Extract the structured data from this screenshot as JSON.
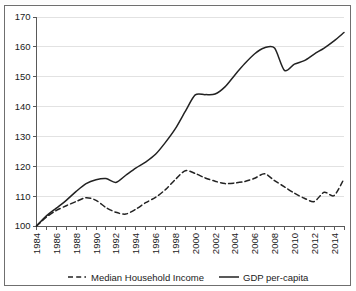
{
  "chart_data": {
    "type": "line",
    "title": "",
    "xlabel": "",
    "ylabel": "",
    "xlim": [
      1984,
      2015
    ],
    "ylim": [
      100,
      170
    ],
    "ytick_step": 10,
    "xtick_step": 2,
    "grid": true,
    "legend_position": "bottom",
    "yticks": [
      "100",
      "110",
      "120",
      "130",
      "140",
      "150",
      "160",
      "170"
    ],
    "xticks": [
      "1984",
      "1986",
      "1988",
      "1990",
      "1992",
      "1994",
      "1996",
      "1998",
      "2000",
      "2002",
      "2004",
      "2006",
      "2008",
      "2010",
      "2012",
      "2014"
    ],
    "x": [
      1984,
      1985,
      1986,
      1987,
      1988,
      1989,
      1990,
      1991,
      1992,
      1993,
      1994,
      1995,
      1996,
      1997,
      1998,
      1999,
      2000,
      2001,
      2002,
      2003,
      2004,
      2005,
      2006,
      2007,
      2008,
      2009,
      2010,
      2011,
      2012,
      2013,
      2014,
      2015
    ],
    "series": [
      {
        "name": "Median Household Income",
        "style": "dashed",
        "color": "#222222",
        "values": [
          100.0,
          103.0,
          105.2,
          106.8,
          108.2,
          109.5,
          108.6,
          106.2,
          104.6,
          104.0,
          105.6,
          107.8,
          109.6,
          112.2,
          115.6,
          118.5,
          117.6,
          116.1,
          115.0,
          114.2,
          114.4,
          114.9,
          116.0,
          117.5,
          115.2,
          113.1,
          111.0,
          109.3,
          108.2,
          111.3,
          110.2,
          115.8
        ]
      },
      {
        "name": "GDP per-capita",
        "style": "solid",
        "color": "#222222",
        "values": [
          100.0,
          103.4,
          106.0,
          108.6,
          111.6,
          114.2,
          115.5,
          115.9,
          114.6,
          117.0,
          119.4,
          121.4,
          124.0,
          128.0,
          132.6,
          138.4,
          143.9,
          144.0,
          144.2,
          146.6,
          150.6,
          154.4,
          157.7,
          159.7,
          159.6,
          152.1,
          154.2,
          155.4,
          157.6,
          159.6,
          162.0,
          164.8
        ]
      }
    ]
  },
  "legend": {
    "items": [
      {
        "label": "Median Household Income",
        "marker": "dashed-line-marker"
      },
      {
        "label": "GDP per-capita",
        "marker": "solid-line-marker"
      }
    ]
  },
  "colors": {
    "axis": "#595959",
    "grid": "#e2e2e2",
    "series_line": "#222222",
    "frame": "#6f6f6f",
    "text": "#1a1a1a",
    "background": "#ffffff"
  }
}
